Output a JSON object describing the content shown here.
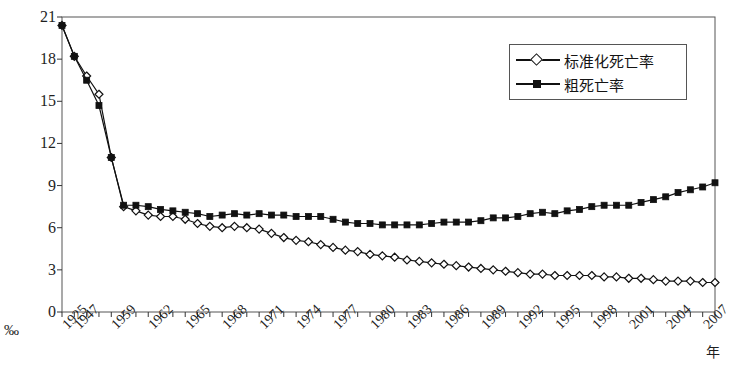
{
  "chart_data": {
    "type": "line",
    "title": "",
    "subtitle": "",
    "xlabel": "年",
    "ylabel": "",
    "unit_label": "‰",
    "xlim": [
      1925,
      2008
    ],
    "ylim": [
      0,
      21
    ],
    "yticks": [
      0,
      3,
      6,
      9,
      12,
      15,
      18,
      21
    ],
    "ytick_labels": [
      "0",
      "3",
      "6",
      "9",
      "12",
      "15",
      "18",
      "21"
    ],
    "xtick_labels": [
      "1925",
      "1947",
      "1959",
      "1962",
      "1965",
      "1968",
      "1971",
      "1974",
      "1977",
      "1980",
      "1983",
      "1986",
      "1989",
      "1992",
      "1995",
      "1998",
      "2001",
      "2004",
      "2007"
    ],
    "grid": false,
    "legend_position": "top-right",
    "x": [
      1925,
      1947,
      1953,
      1956,
      1959,
      1960,
      1961,
      1962,
      1963,
      1964,
      1965,
      1966,
      1967,
      1968,
      1969,
      1970,
      1971,
      1972,
      1973,
      1974,
      1975,
      1976,
      1977,
      1978,
      1979,
      1980,
      1981,
      1982,
      1983,
      1984,
      1985,
      1986,
      1987,
      1988,
      1989,
      1990,
      1991,
      1992,
      1993,
      1994,
      1995,
      1996,
      1997,
      1998,
      1999,
      2000,
      2001,
      2002,
      2003,
      2004,
      2005,
      2006,
      2007,
      2008
    ],
    "series": [
      {
        "name": "标准化死亡率",
        "marker": "open-diamond",
        "values": [
          20.4,
          18.2,
          16.8,
          15.5,
          11.0,
          7.5,
          7.2,
          6.9,
          6.8,
          6.8,
          6.6,
          6.3,
          6.1,
          6.0,
          6.1,
          6.0,
          5.9,
          5.6,
          5.3,
          5.1,
          5.0,
          4.8,
          4.6,
          4.4,
          4.3,
          4.1,
          4.0,
          3.9,
          3.7,
          3.6,
          3.5,
          3.4,
          3.3,
          3.2,
          3.1,
          3.0,
          2.9,
          2.8,
          2.7,
          2.7,
          2.6,
          2.6,
          2.6,
          2.6,
          2.5,
          2.5,
          2.4,
          2.4,
          2.3,
          2.2,
          2.2,
          2.2,
          2.1,
          2.1
        ]
      },
      {
        "name": "粗死亡率",
        "marker": "filled-square",
        "values": [
          20.4,
          18.2,
          16.5,
          14.7,
          11.0,
          7.6,
          7.6,
          7.5,
          7.3,
          7.2,
          7.1,
          7.0,
          6.8,
          6.9,
          7.0,
          6.9,
          7.0,
          6.9,
          6.9,
          6.8,
          6.8,
          6.8,
          6.6,
          6.4,
          6.3,
          6.3,
          6.2,
          6.2,
          6.2,
          6.2,
          6.3,
          6.4,
          6.4,
          6.4,
          6.5,
          6.7,
          6.7,
          6.8,
          7.0,
          7.1,
          7.0,
          7.2,
          7.3,
          7.5,
          7.6,
          7.6,
          7.6,
          7.8,
          8.0,
          8.2,
          8.5,
          8.7,
          8.9,
          9.2
        ]
      }
    ]
  },
  "legend": {
    "items": [
      {
        "label": "标准化死亡率",
        "marker": "open-diamond"
      },
      {
        "label": "粗死亡率",
        "marker": "filled-square"
      }
    ]
  },
  "axes": {
    "y_unit": "‰",
    "x_unit": "年"
  },
  "colors": {
    "line": "#111111",
    "frame": "#555555",
    "background": "#ffffff",
    "text": "#1f1f1f"
  }
}
